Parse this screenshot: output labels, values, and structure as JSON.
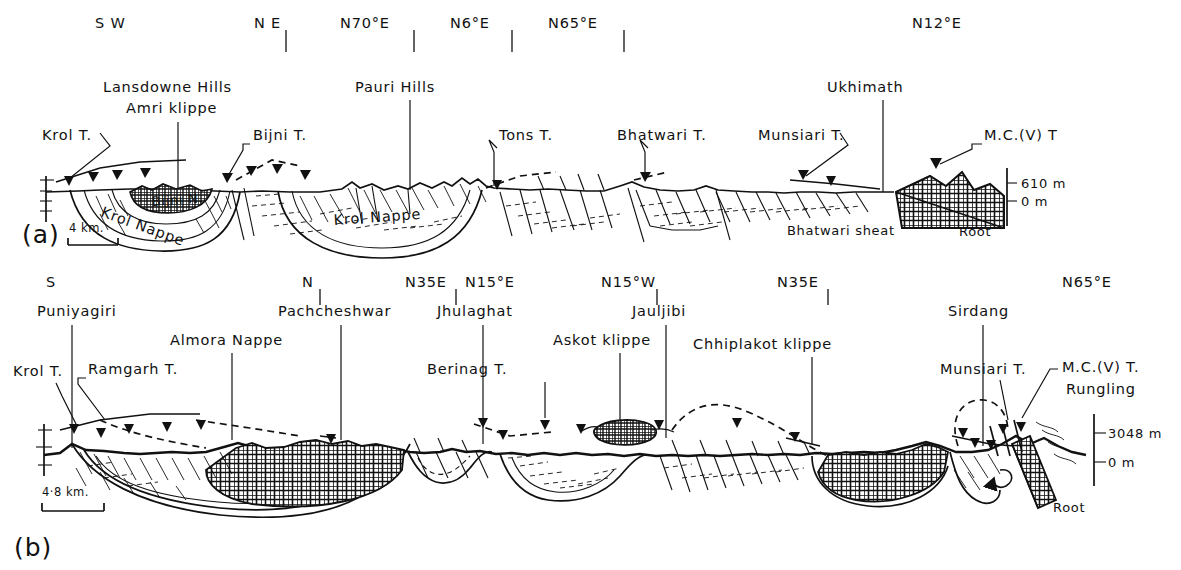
{
  "figure": {
    "type": "geological-cross-section",
    "panels": [
      {
        "id": "(a)",
        "scale_label": "4 km.",
        "bearings": [
          {
            "text": "S W",
            "x": 95,
            "y": 28,
            "tick": false
          },
          {
            "text": "N E",
            "x": 254,
            "y": 28,
            "tick": true
          },
          {
            "text": "N70°E",
            "x": 340,
            "y": 28,
            "tick": true
          },
          {
            "text": "N6°E",
            "x": 450,
            "y": 28,
            "tick": true
          },
          {
            "text": "N65°E",
            "x": 548,
            "y": 28,
            "tick": true
          },
          {
            "text": "N12°E",
            "x": 912,
            "y": 28,
            "tick": false
          }
        ],
        "places": [
          {
            "text": "Lansdowne Hills",
            "x": 103,
            "y": 92
          },
          {
            "text": "Amri klippe",
            "x": 126,
            "y": 113
          },
          {
            "text": "Pauri Hills",
            "x": 355,
            "y": 92
          },
          {
            "text": "Ukhimath",
            "x": 827,
            "y": 92
          }
        ],
        "thrusts": [
          {
            "text": "Krol T.",
            "x": 42,
            "y": 140
          },
          {
            "text": "Bijni T.",
            "x": 253,
            "y": 140
          },
          {
            "text": "Tons T.",
            "x": 499,
            "y": 140
          },
          {
            "text": "Bhatwari T.",
            "x": 617,
            "y": 140
          },
          {
            "text": "Munsiari T.",
            "x": 758,
            "y": 140
          },
          {
            "text": "M.C.(V) T",
            "x": 984,
            "y": 140
          }
        ],
        "interior": [
          {
            "text": "Bijni N.",
            "x": 165,
            "y": 205
          },
          {
            "text": "Krol Nappe",
            "x": 118,
            "y": 219
          },
          {
            "text": "Krol Nappe",
            "x": 355,
            "y": 222
          },
          {
            "text": "Bhatwari sheat",
            "x": 787,
            "y": 232
          },
          {
            "text": "Root",
            "x": 959,
            "y": 233
          }
        ],
        "elevations": [
          {
            "text": "610 m",
            "x": 1021,
            "y": 186
          },
          {
            "text": "0 m",
            "x": 1021,
            "y": 204
          }
        ]
      },
      {
        "id": "(b)",
        "scale_label": "4·8 km.",
        "bearings": [
          {
            "text": "S",
            "x": 46,
            "y": 287,
            "tick": false
          },
          {
            "text": "N",
            "x": 302,
            "y": 287,
            "tick": true
          },
          {
            "text": "N35E",
            "x": 405,
            "y": 287,
            "tick": true
          },
          {
            "text": "N15°E",
            "x": 465,
            "y": 287,
            "tick": false
          },
          {
            "text": "N15°W",
            "x": 601,
            "y": 287,
            "tick": true
          },
          {
            "text": "N35E",
            "x": 777,
            "y": 287,
            "tick": true
          },
          {
            "text": "N65°E",
            "x": 1062,
            "y": 287,
            "tick": false
          }
        ],
        "places": [
          {
            "text": "Puniyagiri",
            "x": 37,
            "y": 316
          },
          {
            "text": "Pachcheshwar",
            "x": 278,
            "y": 316
          },
          {
            "text": "Jhulaghat",
            "x": 437,
            "y": 316
          },
          {
            "text": "Jauljibi",
            "x": 632,
            "y": 316
          },
          {
            "text": "Sirdang",
            "x": 948,
            "y": 316
          }
        ],
        "features": [
          {
            "text": "Almora Nappe",
            "x": 170,
            "y": 345
          },
          {
            "text": "Askot klippe",
            "x": 553,
            "y": 345
          },
          {
            "text": "Chhiplakot klippe",
            "x": 693,
            "y": 349
          },
          {
            "text": "Berinag T.",
            "x": 427,
            "y": 374
          },
          {
            "text": "Krol T.",
            "x": 13,
            "y": 376
          },
          {
            "text": "Ramgarh T.",
            "x": 88,
            "y": 374
          },
          {
            "text": "Munsiari T.",
            "x": 940,
            "y": 374
          },
          {
            "text": "M.C.(V) T.",
            "x": 1062,
            "y": 372
          },
          {
            "text": "Rungling",
            "x": 1066,
            "y": 394
          },
          {
            "text": "Root",
            "x": 1053,
            "y": 509
          }
        ],
        "elevations": [
          {
            "text": "3048 m",
            "x": 1108,
            "y": 437
          },
          {
            "text": "0 m",
            "x": 1108,
            "y": 466
          }
        ]
      }
    ]
  }
}
